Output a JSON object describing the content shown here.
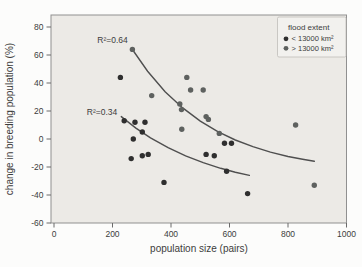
{
  "chart_data": {
    "type": "scatter",
    "title": "",
    "xlabel": "population size (pairs)",
    "ylabel": "change in breeding population (%)",
    "xlim": [
      0,
      1000
    ],
    "ylim": [
      -60,
      80
    ],
    "x_ticks": [
      0,
      200,
      400,
      600,
      800,
      1000
    ],
    "y_ticks": [
      80,
      60,
      40,
      20,
      0,
      -20,
      -40,
      -60
    ],
    "grid": false,
    "plot_background": "#ECEAE6",
    "legend": {
      "title": "flood extent",
      "position": "top-right",
      "panel_fill": "#F2F1EE",
      "panel_stroke": "#bcbab5"
    },
    "series": [
      {
        "name": "< 13000 km²",
        "color": "#2f2f2f",
        "points": [
          [
            227,
            44
          ],
          [
            240,
            13
          ],
          [
            277,
            12
          ],
          [
            311,
            12
          ],
          [
            302,
            5
          ],
          [
            271,
            0
          ],
          [
            264,
            -14
          ],
          [
            302,
            -12
          ],
          [
            322,
            -11
          ],
          [
            376,
            -31
          ],
          [
            520,
            -11
          ],
          [
            548,
            -12
          ],
          [
            583,
            -3
          ],
          [
            607,
            -3
          ],
          [
            590,
            -23
          ],
          [
            662,
            -39
          ]
        ]
      },
      {
        "name": "> 13000 km²",
        "color": "#5e615f",
        "points": [
          [
            268,
            64
          ],
          [
            334,
            31
          ],
          [
            430,
            25
          ],
          [
            436,
            21
          ],
          [
            454,
            44
          ],
          [
            467,
            35
          ],
          [
            510,
            35
          ],
          [
            437,
            7
          ],
          [
            520,
            16
          ],
          [
            528,
            14
          ],
          [
            565,
            4
          ],
          [
            826,
            10
          ],
          [
            890,
            -33
          ]
        ]
      }
    ],
    "trendlines": [
      {
        "label": "R²=0.64",
        "r_squared": 0.64,
        "series": "> 13000 km²",
        "label_xy": [
          148,
          71
        ],
        "color": "#4f4f4f",
        "points": [
          [
            268,
            63.9
          ],
          [
            320,
            48.4
          ],
          [
            380,
            33.8
          ],
          [
            440,
            22.2
          ],
          [
            500,
            12.8
          ],
          [
            560,
            5.3
          ],
          [
            620,
            -0.7
          ],
          [
            680,
            -5.5
          ],
          [
            740,
            -9.4
          ],
          [
            800,
            -12.5
          ],
          [
            850,
            -14.5
          ],
          [
            890,
            -15.9
          ]
        ]
      },
      {
        "label": "R²=0.34",
        "r_squared": 0.34,
        "series": "< 13000 km²",
        "label_xy": [
          112,
          19
        ],
        "color": "#4f4f4f",
        "points": [
          [
            230,
            16.0
          ],
          [
            280,
            7.8
          ],
          [
            330,
            0.8
          ],
          [
            390,
            -6.2
          ],
          [
            450,
            -12.1
          ],
          [
            510,
            -16.9
          ],
          [
            570,
            -20.9
          ],
          [
            620,
            -23.7
          ],
          [
            668,
            -26.0
          ]
        ]
      }
    ]
  }
}
